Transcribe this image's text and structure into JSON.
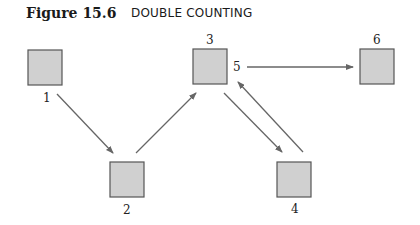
{
  "figure": {
    "number": "Figure 15.6",
    "title": "DOUBLE COUNTING"
  },
  "colors": {
    "box_fill": "#d0d0d0",
    "box_stroke": "#555555",
    "arrow": "#666666"
  },
  "nodes": [
    {
      "id": "1",
      "label": "1",
      "x": 28,
      "y": 50,
      "w": 34,
      "h": 35,
      "label_x": 43,
      "label_y": 102
    },
    {
      "id": "2",
      "label": "2",
      "x": 110,
      "y": 162,
      "w": 34,
      "h": 35,
      "label_x": 123,
      "label_y": 214
    },
    {
      "id": "3",
      "label": "3",
      "x": 193,
      "y": 49,
      "w": 34,
      "h": 35,
      "label_x": 206,
      "label_y": 44
    },
    {
      "id": "4",
      "label": "4",
      "x": 277,
      "y": 162,
      "w": 34,
      "h": 35,
      "label_x": 291,
      "label_y": 213
    },
    {
      "id": "6",
      "label": "6",
      "x": 360,
      "y": 49,
      "w": 34,
      "h": 35,
      "label_x": 373,
      "label_y": 44
    }
  ],
  "extra_labels": [
    {
      "id": "5",
      "label": "5",
      "x": 233,
      "y": 71
    }
  ],
  "edges": [
    {
      "from": "1",
      "to": "2",
      "x1": 57,
      "y1": 94,
      "x2": 113,
      "y2": 153
    },
    {
      "from": "2",
      "to": "3",
      "x1": 136,
      "y1": 153,
      "x2": 196,
      "y2": 93
    },
    {
      "from": "3",
      "to": "4",
      "x1": 224,
      "y1": 93,
      "x2": 282,
      "y2": 152
    },
    {
      "from": "4",
      "to": "5",
      "x1": 303,
      "y1": 152,
      "x2": 238,
      "y2": 82
    },
    {
      "from": "5",
      "to": "6",
      "x1": 247,
      "y1": 67,
      "x2": 353,
      "y2": 67
    }
  ]
}
